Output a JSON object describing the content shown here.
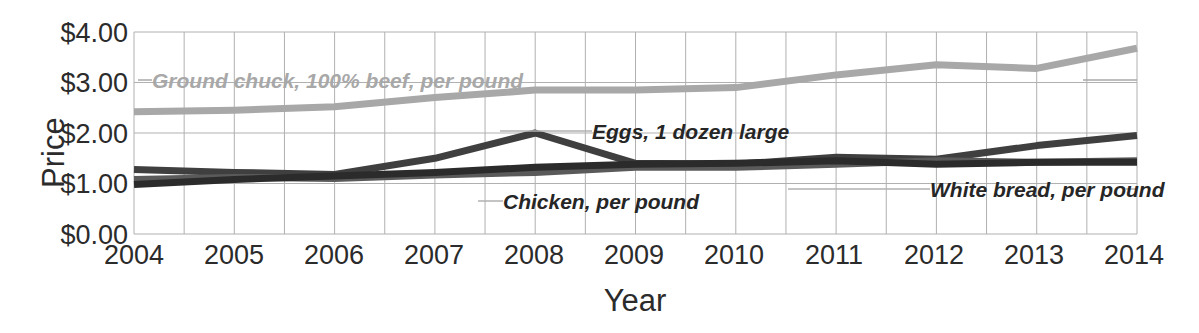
{
  "chart_data": {
    "type": "line",
    "title": "",
    "xlabel": "Year",
    "ylabel": "Price",
    "x": [
      2004,
      2005,
      2006,
      2007,
      2008,
      2009,
      2010,
      2011,
      2012,
      2013,
      2014
    ],
    "xtick_labels": [
      "2004",
      "2005",
      "2006",
      "2007",
      "2008",
      "2009",
      "2010",
      "2011",
      "2012",
      "2013",
      "2014"
    ],
    "ytick_labels": [
      "$4.00",
      "$3.00",
      "$2.00",
      "$1.00",
      "$0.00"
    ],
    "ytick_values": [
      4.0,
      3.0,
      2.0,
      1.0,
      0.0
    ],
    "ylim": [
      0.0,
      4.0
    ],
    "xlim": [
      2004,
      2014
    ],
    "grid": true,
    "grid_minor_x": true,
    "legend_position": "inline-annotations",
    "series": [
      {
        "name": "Ground chuck, 100% beef, per pound",
        "color": "#a8a8a8",
        "width": 7,
        "values": [
          2.42,
          2.45,
          2.52,
          2.7,
          2.85,
          2.85,
          2.9,
          3.15,
          3.35,
          3.28,
          3.68
        ]
      },
      {
        "name": "Eggs, 1 dozen large",
        "color": "#3f3f3f",
        "width": 7,
        "values": [
          1.28,
          1.22,
          1.18,
          1.5,
          2.0,
          1.4,
          1.38,
          1.52,
          1.48,
          1.75,
          1.95
        ]
      },
      {
        "name": "Chicken, per pound",
        "color": "#5a5a5a",
        "width": 7,
        "values": [
          1.08,
          1.12,
          1.1,
          1.17,
          1.22,
          1.32,
          1.32,
          1.38,
          1.45,
          1.42,
          1.45
        ]
      },
      {
        "name": "White bread, per pound",
        "color": "#2b2b2b",
        "width": 7,
        "values": [
          0.98,
          1.08,
          1.15,
          1.22,
          1.32,
          1.38,
          1.4,
          1.45,
          1.38,
          1.42,
          1.42
        ]
      }
    ],
    "annotations": [
      {
        "text": "Ground chuck, 100% beef, per pound",
        "style": "light",
        "x": 152,
        "y": 69
      },
      {
        "text": "Eggs, 1 dozen large",
        "style": "dark",
        "x": 592,
        "y": 120
      },
      {
        "text": "Chicken, per pound",
        "style": "dark",
        "x": 503,
        "y": 190
      },
      {
        "text": "White bread, per pound",
        "style": "dark",
        "x": 930,
        "y": 178
      }
    ]
  },
  "axis": {
    "ylabel": "Price",
    "xlabel": "Year"
  },
  "colors": {
    "grid": "#b0b0b0",
    "axis_text": "#2b2b2b",
    "ground_chuck": "#a8a8a8",
    "eggs": "#3f3f3f",
    "chicken": "#5a5a5a",
    "white_bread": "#2b2b2b",
    "background": "#ffffff"
  }
}
